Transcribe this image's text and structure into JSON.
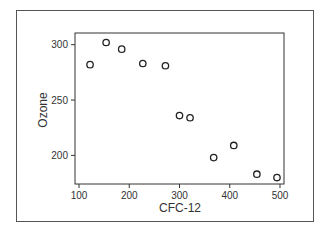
{
  "chart_data": {
    "type": "scatter",
    "title": "",
    "xlabel": "CFC-12",
    "ylabel": "Ozone",
    "xlim": [
      90,
      510
    ],
    "ylim": [
      171,
      310
    ],
    "xticks": [
      100,
      200,
      300,
      400,
      500
    ],
    "yticks": [
      200,
      250,
      300
    ],
    "grid": false,
    "legend": null,
    "marker": "open-circle",
    "points": [
      {
        "x": 122,
        "y": 282
      },
      {
        "x": 154,
        "y": 302
      },
      {
        "x": 185,
        "y": 296
      },
      {
        "x": 227,
        "y": 283
      },
      {
        "x": 272,
        "y": 281
      },
      {
        "x": 300,
        "y": 236
      },
      {
        "x": 321,
        "y": 234
      },
      {
        "x": 368,
        "y": 198
      },
      {
        "x": 408,
        "y": 209
      },
      {
        "x": 454,
        "y": 183
      },
      {
        "x": 494,
        "y": 180
      }
    ]
  },
  "axis": {
    "x_title": "CFC-12",
    "y_title": "Ozone",
    "x_tick_labels": [
      "100",
      "200",
      "300",
      "400",
      "500"
    ],
    "y_tick_labels": [
      "200",
      "250",
      "300"
    ]
  }
}
